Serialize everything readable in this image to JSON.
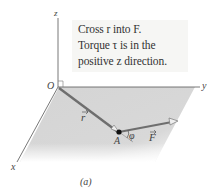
{
  "figure": {
    "caption": "(a)",
    "note": {
      "line1": "Cross r into F.",
      "line2": "Torque τ is in the",
      "line3": "positive z direction."
    },
    "axes": {
      "x": "x",
      "y": "y",
      "z": "z",
      "origin": "O"
    },
    "vectors": {
      "r": "r",
      "F": "F"
    },
    "point": "A",
    "angle": "φ",
    "colors": {
      "plane": "#d6d6d6",
      "vector": "#6e6e6e",
      "axis": "#555555",
      "note_bg": "#f6f6f4"
    }
  }
}
